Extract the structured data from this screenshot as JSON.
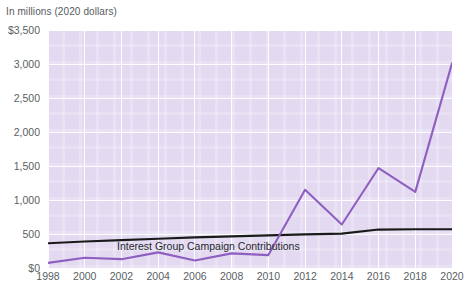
{
  "chart_data": {
    "type": "line",
    "title": "",
    "subtitle": "In millions (2020 dollars)",
    "xlabel": "",
    "ylabel": "",
    "ylim": [
      0,
      3500
    ],
    "xlim": [
      1998,
      2020
    ],
    "grid": true,
    "legend_position": "inline-annotations",
    "y_ticks": [
      {
        "value": 3500,
        "label": "$3,500"
      },
      {
        "value": 3000,
        "label": "3,000"
      },
      {
        "value": 2500,
        "label": "2,500"
      },
      {
        "value": 2000,
        "label": "2,000"
      },
      {
        "value": 1500,
        "label": "1,500"
      },
      {
        "value": 1000,
        "label": "1,000"
      },
      {
        "value": 500,
        "label": "500"
      },
      {
        "value": 0,
        "label": "$0"
      }
    ],
    "x_ticks": [
      {
        "value": 1998,
        "label": "1998"
      },
      {
        "value": 2000,
        "label": "2000"
      },
      {
        "value": 2002,
        "label": "2002"
      },
      {
        "value": 2004,
        "label": "2004"
      },
      {
        "value": 2006,
        "label": "2006"
      },
      {
        "value": 2008,
        "label": "2008"
      },
      {
        "value": 2010,
        "label": "2010"
      },
      {
        "value": 2012,
        "label": "2012"
      },
      {
        "value": 2014,
        "label": "2014"
      },
      {
        "value": 2016,
        "label": "2016"
      },
      {
        "value": 2018,
        "label": "2018"
      },
      {
        "value": 2020,
        "label": "2020"
      }
    ],
    "x": [
      1998,
      2000,
      2002,
      2004,
      2006,
      2008,
      2010,
      2012,
      2014,
      2016,
      2018,
      2020
    ],
    "series": [
      {
        "name": "Interest Group Campaign Contributions",
        "color": "#1a1a1a",
        "values": [
          365,
          390,
          410,
          430,
          450,
          465,
          480,
          495,
          505,
          565,
          570,
          570
        ]
      },
      {
        "name": "Interest Group Direct Spending",
        "color": "#8e5fc0",
        "values": [
          75,
          150,
          130,
          230,
          110,
          215,
          190,
          1150,
          640,
          1470,
          1120,
          3010
        ]
      }
    ],
    "annotations": [
      {
        "text": "Interest Group Campaign Contributions",
        "series": "Interest Group Campaign Contributions"
      },
      {
        "text": "Interest Group Direct Spending",
        "series": "Interest Group Direct Spending"
      }
    ],
    "colors": {
      "plot_background": "#e3daf2",
      "gridline": "#ffffff",
      "page_background": "#ffffff",
      "axis_text": "#5a5f63",
      "annotation_text": "#26292c",
      "contributions_line": "#1a1a1a",
      "direct_spending_line": "#8e5fc0"
    }
  }
}
